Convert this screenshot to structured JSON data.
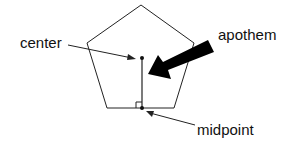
{
  "diagram": {
    "shape": "regular pentagon",
    "labels": {
      "center": "center",
      "apothem": "apothem",
      "midpoint": "midpoint"
    },
    "colors": {
      "stroke": "#222222",
      "fill": "#ffffff",
      "arrow": "#000000"
    }
  }
}
